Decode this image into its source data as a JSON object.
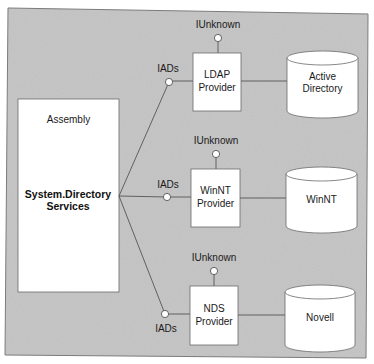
{
  "diagram": {
    "colors": {
      "panel_fill": "#c4c4c4",
      "panel_border": "#7a7a7a",
      "box_fill": "#ffffff",
      "line": "#555555",
      "text": "#1a1a1a"
    },
    "assembly": {
      "header": "Assembly",
      "name_line1": "System.Directory",
      "name_line2": "Services"
    },
    "providers": [
      {
        "name_line1": "LDAP",
        "name_line2": "Provider",
        "interface_in": "IADs",
        "interface_top": "IUnknown",
        "store_line1": "Active",
        "store_line2": "Directory"
      },
      {
        "name_line1": "WinNT",
        "name_line2": "Provider",
        "interface_in": "IADs",
        "interface_top": "IUnknown",
        "store_line1": "WinNT",
        "store_line2": ""
      },
      {
        "name_line1": "NDS",
        "name_line2": "Provider",
        "interface_in": "IADs",
        "interface_top": "IUnknown",
        "store_line1": "Novell",
        "store_line2": ""
      }
    ]
  }
}
